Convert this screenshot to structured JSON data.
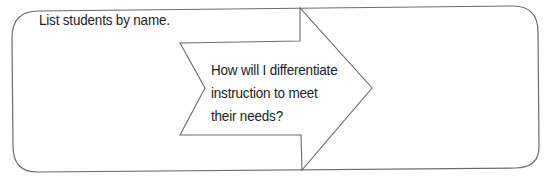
{
  "worksheet": {
    "prompt_label": "List students by name.",
    "arrow_question": "How will I differentiate\ninstruction to meet\ntheir needs?",
    "stroke_color": "#6b6b6b",
    "text_color": "#222222"
  }
}
